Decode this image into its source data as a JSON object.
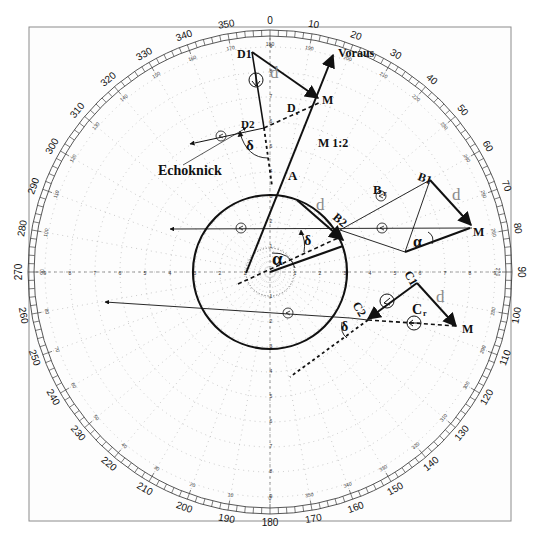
{
  "diagram": {
    "center": {
      "x": 270,
      "y": 272
    },
    "colors": {
      "ink": "#111111",
      "grid": "#9a9a9a",
      "frame": "#8c8c8c",
      "d_label": "#8a8a8a"
    },
    "bearing_ring": {
      "outer_labels": [
        "0",
        "10",
        "20",
        "30",
        "40",
        "50",
        "60",
        "70",
        "80",
        "90",
        "100",
        "110",
        "120",
        "130",
        "140",
        "150",
        "160",
        "170",
        "180",
        "190",
        "200",
        "210",
        "220",
        "230",
        "240",
        "250",
        "260",
        "270",
        "280",
        "290",
        "300",
        "310",
        "320",
        "330",
        "340",
        "350"
      ],
      "inner_labels": [
        "180",
        "190",
        "200",
        "210",
        "220",
        "230",
        "240",
        "250",
        "260",
        "270",
        "280",
        "290",
        "300",
        "310",
        "320",
        "330",
        "340",
        "350",
        "0",
        "10",
        "20",
        "30",
        "40",
        "50",
        "60",
        "70",
        "80",
        "90",
        "100",
        "110",
        "120",
        "130",
        "140",
        "150",
        "160",
        "170"
      ]
    },
    "range_ticks": [
      "1",
      "2",
      "3",
      "4",
      "5",
      "6",
      "7",
      "8",
      "9"
    ],
    "labels": {
      "voraus": "Voraus",
      "scale": "M 1:2",
      "echoknick": "Echoknick",
      "a": "A",
      "alpha_main": "α",
      "delta_main": "δ",
      "d": "d",
      "d1": "D1",
      "d2": "D2",
      "dr": "D",
      "dr_sub": "r",
      "m": "M",
      "delta_echo": "δ",
      "b1": "B1",
      "b2": "B2",
      "br": "B",
      "br_sub": "r",
      "alpha_b": "α",
      "c1": "C1",
      "c2": "C2",
      "cr": "C",
      "cr_sub": "r",
      "delta_c": "δ"
    }
  }
}
